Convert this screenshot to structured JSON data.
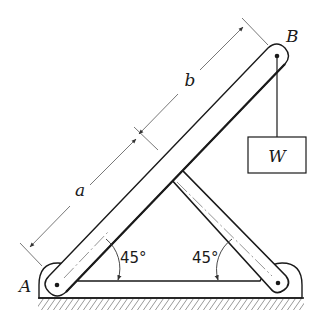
{
  "figure": {
    "type": "mechanics-diagram",
    "labels": {
      "point_a": "A",
      "point_b": "B",
      "weight": "W",
      "dim_a": "a",
      "dim_b": "b",
      "angle_left": "45°",
      "angle_right": "45°"
    },
    "colors": {
      "line": "#1a1a1a",
      "dimension": "#555555",
      "background": "#ffffff"
    }
  }
}
